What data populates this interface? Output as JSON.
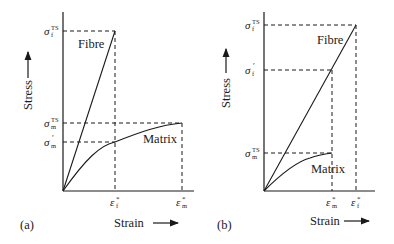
{
  "panels": [
    {
      "id": "a",
      "panel_label": "(a)",
      "x_axis_label": "Strain",
      "y_axis_label": "Stress",
      "curves": {
        "fibre": "Fibre",
        "matrix": "Matrix"
      },
      "y_ticks": {
        "fibre_ts": "σ",
        "fibre_ts_sub": "f",
        "fibre_ts_sup": "TS",
        "matrix_ts": "σ",
        "matrix_ts_sub": "m",
        "matrix_ts_sup": "TS",
        "matrix_prime": "σ",
        "matrix_prime_sub": "m",
        "matrix_prime_sup": "′"
      },
      "x_ticks": {
        "fibre_fail": "ε",
        "fibre_fail_sub": "f",
        "fibre_fail_sup": "*",
        "matrix_fail": "ε",
        "matrix_fail_sub": "m",
        "matrix_fail_sup": "*"
      }
    },
    {
      "id": "b",
      "panel_label": "(b)",
      "x_axis_label": "Strain",
      "y_axis_label": "Stress",
      "curves": {
        "fibre": "Fibre",
        "matrix": "Matrix"
      },
      "y_ticks": {
        "fibre_ts": "σ",
        "fibre_ts_sub": "f",
        "fibre_ts_sup": "TS",
        "fibre_prime": "σ",
        "fibre_prime_sub": "f",
        "fibre_prime_sup": "′",
        "matrix_ts": "σ",
        "matrix_ts_sub": "m",
        "matrix_ts_sup": "TS"
      },
      "x_ticks": {
        "matrix_fail": "ε",
        "matrix_fail_sub": "m",
        "matrix_fail_sup": "*",
        "fibre_fail": "ε",
        "fibre_fail_sub": "f",
        "fibre_fail_sup": "*"
      }
    }
  ]
}
